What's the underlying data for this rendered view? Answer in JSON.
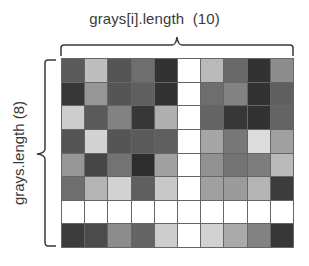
{
  "labels": {
    "columns": "grays[i].length  (10)",
    "rows": "grays.length (8)"
  },
  "grid": {
    "rows": 8,
    "cols": 10,
    "values": [
      [
        90,
        190,
        85,
        110,
        50,
        255,
        185,
        105,
        50,
        140
      ],
      [
        55,
        150,
        85,
        95,
        50,
        255,
        110,
        130,
        50,
        95
      ],
      [
        205,
        90,
        130,
        55,
        175,
        255,
        100,
        55,
        50,
        100
      ],
      [
        85,
        210,
        85,
        90,
        95,
        255,
        165,
        120,
        220,
        160
      ],
      [
        150,
        70,
        115,
        45,
        160,
        255,
        145,
        115,
        125,
        185
      ],
      [
        110,
        180,
        210,
        95,
        200,
        255,
        160,
        155,
        180,
        60
      ],
      [
        255,
        255,
        255,
        255,
        255,
        255,
        255,
        255,
        255,
        255
      ],
      [
        60,
        75,
        140,
        100,
        205,
        255,
        210,
        170,
        130,
        55
      ]
    ]
  },
  "colors": {
    "bracket": "#3a3a3a",
    "grid_line": "#666666",
    "text": "#3a3a3a"
  }
}
